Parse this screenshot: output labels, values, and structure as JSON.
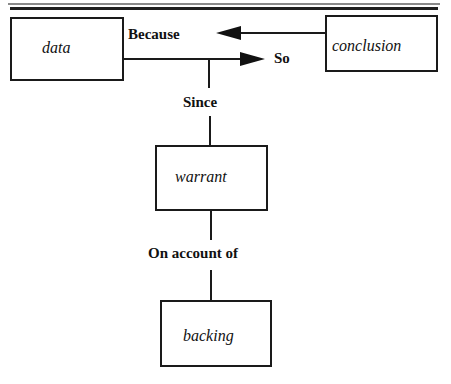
{
  "diagram": {
    "type": "Toulmin argument model",
    "nodes": {
      "data": {
        "label": "data"
      },
      "conclusion": {
        "label": "conclusion"
      },
      "warrant": {
        "label": "warrant"
      },
      "backing": {
        "label": "backing"
      }
    },
    "connectors": {
      "because": {
        "label": "Because",
        "from": "conclusion",
        "to": "data"
      },
      "so": {
        "label": "So",
        "from": "data",
        "to": "conclusion"
      },
      "since": {
        "label": "Since",
        "from": "warrant",
        "to": "data-so-line"
      },
      "on_account_of": {
        "label": "On account of",
        "from": "backing",
        "to": "warrant"
      }
    },
    "colors": {
      "line": "#1a1a1a",
      "rule_thin": "#8a8a8a",
      "rule_thick": "#1f1f1f",
      "background": "#ffffff"
    }
  }
}
